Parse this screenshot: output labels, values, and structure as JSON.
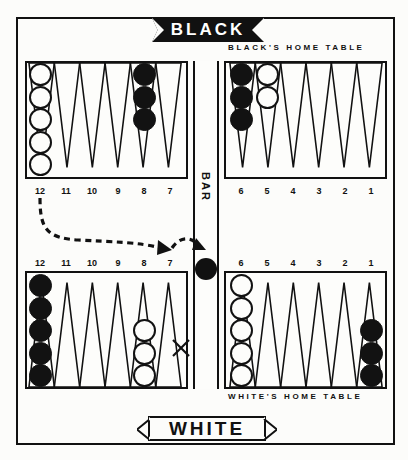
{
  "board": {
    "title_top": "BLACK",
    "title_bottom": "WHITE",
    "bar_label": "BAR",
    "black_home_caption": "BLACK'S HOME TABLE",
    "white_home_caption": "WHITE'S HOME TABLE",
    "colors": {
      "black": "#121212",
      "white": "#fdfdfb",
      "line": "#111111",
      "background": "#fdfdfb"
    }
  },
  "point_numbers": {
    "top_left": [
      "12",
      "11",
      "10",
      "9",
      "8",
      "7"
    ],
    "top_right": [
      "6",
      "5",
      "4",
      "3",
      "2",
      "1"
    ],
    "bottom_left": [
      "12",
      "11",
      "10",
      "9",
      "8",
      "7"
    ],
    "bottom_right": [
      "6",
      "5",
      "4",
      "3",
      "2",
      "1"
    ]
  },
  "checkers": {
    "top_left": [
      {
        "point": "12",
        "color": "white",
        "count": 5
      },
      {
        "point": "8",
        "color": "black",
        "count": 3
      }
    ],
    "top_right": [
      {
        "point": "6",
        "color": "black",
        "count": 3
      },
      {
        "point": "5",
        "color": "white",
        "count": 2
      }
    ],
    "bottom_left": [
      {
        "point": "12",
        "color": "black",
        "count": 5
      },
      {
        "point": "8",
        "color": "white",
        "count": 3
      }
    ],
    "bottom_right": [
      {
        "point": "6",
        "color": "white",
        "count": 5
      },
      {
        "point": "1",
        "color": "black",
        "count": 3
      }
    ],
    "bar": [
      {
        "color": "black",
        "count": 1
      }
    ]
  },
  "annotations": {
    "move_arrow_1": {
      "from": "12",
      "to": "8",
      "style": "dashed-curve"
    },
    "move_arrow_2": {
      "from": "8",
      "to": "7",
      "style": "dashed-arc"
    },
    "target_mark": {
      "point": "7",
      "symbol": "X"
    }
  }
}
